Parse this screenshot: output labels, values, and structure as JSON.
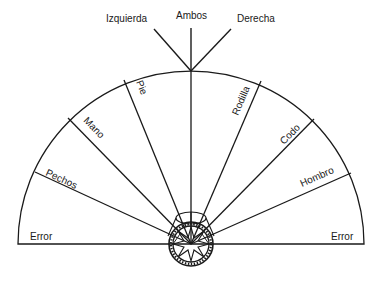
{
  "diagram": {
    "type": "semicircular-selector-dial",
    "colors": {
      "ink": "#1a1a1a",
      "background": "#ffffff"
    },
    "top_labels": [
      {
        "id": "left",
        "text": "Izquierda"
      },
      {
        "id": "both",
        "text": "Ambos"
      },
      {
        "id": "right",
        "text": "Derecha"
      }
    ],
    "sectors": [
      {
        "id": "error-left",
        "text": "Error"
      },
      {
        "id": "pechos",
        "text": "Pechos"
      },
      {
        "id": "mano",
        "text": "Mano"
      },
      {
        "id": "pie",
        "text": "Pie"
      },
      {
        "id": "rodilla",
        "text": "Rodilla"
      },
      {
        "id": "codo",
        "text": "Codo"
      },
      {
        "id": "hombro",
        "text": "Hombro"
      },
      {
        "id": "error-right",
        "text": "Error"
      }
    ]
  }
}
